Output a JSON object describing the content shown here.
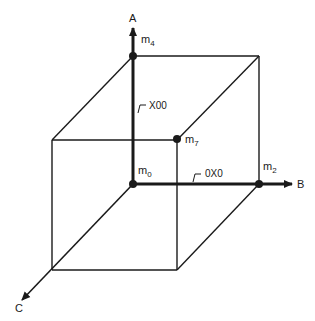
{
  "diagram": {
    "type": "3-cube (Boolean variable cube)",
    "axes": [
      {
        "id": "A",
        "label": "A",
        "direction": "up"
      },
      {
        "id": "B",
        "label": "B",
        "direction": "right"
      },
      {
        "id": "C",
        "label": "C",
        "direction": "down-left"
      }
    ],
    "vertices": [
      {
        "id": "m0",
        "base": "m",
        "sub": "0",
        "marked": true
      },
      {
        "id": "m2",
        "base": "m",
        "sub": "2",
        "marked": true
      },
      {
        "id": "m4",
        "base": "m",
        "sub": "4",
        "marked": true
      },
      {
        "id": "m7",
        "base": "m",
        "sub": "7",
        "marked": true
      }
    ],
    "edge_labels": [
      {
        "id": "x00",
        "text": "X00",
        "edge": "m0-m4"
      },
      {
        "id": "0x0",
        "text": "0X0",
        "edge": "m0-m2"
      }
    ],
    "colors": {
      "stroke": "#1a1a1a",
      "background": "#ffffff"
    }
  }
}
